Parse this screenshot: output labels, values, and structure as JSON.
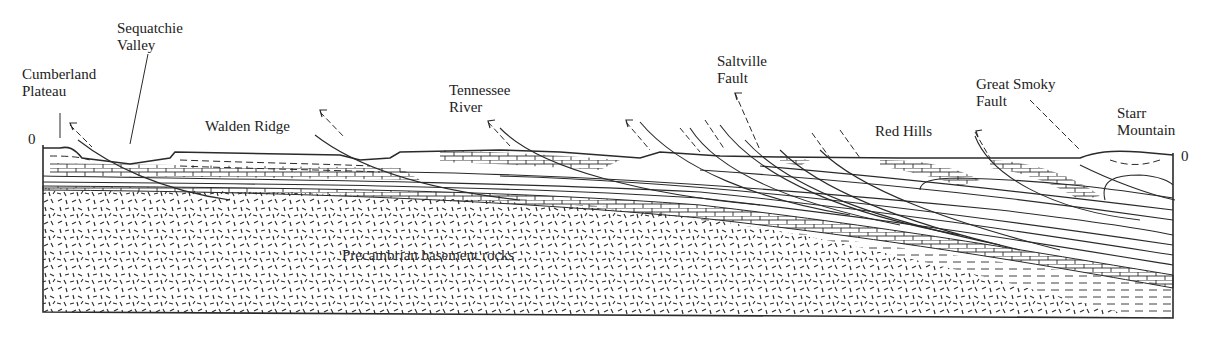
{
  "figure": {
    "type": "geologic cross-section",
    "caption_fragment": "…ection of …e … g…, … …, pp…",
    "labels": {
      "cumberland_plateau": [
        "Cumberland",
        "Plateau"
      ],
      "sequatchie_valley": [
        "Sequatchie",
        "Valley"
      ],
      "walden_ridge": "Walden Ridge",
      "tennessee_river": [
        "Tennessee",
        "River"
      ],
      "saltville_fault": [
        "Saltville",
        "Fault"
      ],
      "red_hills": "Red Hills",
      "great_smoky_fault": [
        "Great Smoky",
        "Fault"
      ],
      "starr_mountain": [
        "Starr",
        "Mountain"
      ],
      "basement": "Precambrian basement rocks",
      "sea_level_left": "0",
      "sea_level_right": "0"
    },
    "colors": {
      "ink": "#2a2a2a",
      "background": "#ffffff"
    }
  }
}
